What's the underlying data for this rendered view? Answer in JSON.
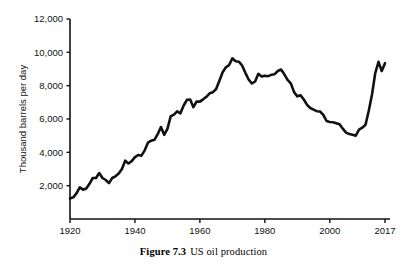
{
  "figure": {
    "caption_number": "Figure 7.3",
    "caption_text": "US oil production"
  },
  "chart_data": {
    "type": "line",
    "title": "",
    "subtitle": "",
    "xlabel": "",
    "ylabel": "Thousand barrels per day",
    "xlim": [
      1920,
      2017
    ],
    "ylim": [
      0,
      12000
    ],
    "grid": false,
    "legend": null,
    "x_ticks": [
      1920,
      1940,
      1960,
      1980,
      2000,
      2017
    ],
    "x_tick_labels": [
      "1920",
      "1940",
      "1960",
      "1980",
      "2000",
      "2017"
    ],
    "y_ticks": [
      2000,
      4000,
      6000,
      8000,
      10000,
      12000
    ],
    "y_tick_labels": [
      "2,000",
      "4,000",
      "6,000",
      "8,000",
      "10,000",
      "12,000"
    ],
    "line_color": "#111111",
    "line_width": 2.6,
    "series": [
      {
        "name": "US oil production",
        "x": [
          1920,
          1921,
          1922,
          1923,
          1924,
          1925,
          1926,
          1927,
          1928,
          1929,
          1930,
          1931,
          1932,
          1933,
          1934,
          1935,
          1936,
          1937,
          1938,
          1939,
          1940,
          1941,
          1942,
          1943,
          1944,
          1945,
          1946,
          1947,
          1948,
          1949,
          1950,
          1951,
          1952,
          1953,
          1954,
          1955,
          1956,
          1957,
          1958,
          1959,
          1960,
          1961,
          1962,
          1963,
          1964,
          1965,
          1966,
          1967,
          1968,
          1969,
          1970,
          1971,
          1972,
          1973,
          1974,
          1975,
          1976,
          1977,
          1978,
          1979,
          1980,
          1981,
          1982,
          1983,
          1984,
          1985,
          1986,
          1987,
          1988,
          1989,
          1990,
          1991,
          1992,
          1993,
          1994,
          1995,
          1996,
          1997,
          1998,
          1999,
          2000,
          2001,
          2002,
          2003,
          2004,
          2005,
          2006,
          2007,
          2008,
          2009,
          2010,
          2011,
          2012,
          2013,
          2014,
          2015,
          2016,
          2017
        ],
        "values": [
          1230,
          1300,
          1540,
          1900,
          1760,
          1830,
          2110,
          2460,
          2460,
          2760,
          2460,
          2340,
          2150,
          2460,
          2560,
          2730,
          3000,
          3500,
          3330,
          3470,
          3710,
          3840,
          3800,
          4120,
          4580,
          4700,
          4750,
          5090,
          5520,
          5050,
          5410,
          6160,
          6260,
          6460,
          6340,
          6810,
          7150,
          7170,
          6710,
          7050,
          7040,
          7180,
          7330,
          7540,
          7610,
          7800,
          8300,
          8810,
          9100,
          9240,
          9640,
          9460,
          9440,
          9210,
          8770,
          8370,
          8130,
          8250,
          8710,
          8550,
          8600,
          8570,
          8650,
          8690,
          8880,
          8970,
          8680,
          8350,
          8140,
          7610,
          7360,
          7420,
          7170,
          6850,
          6660,
          6560,
          6470,
          6450,
          6250,
          5880,
          5820,
          5800,
          5750,
          5680,
          5420,
          5180,
          5100,
          5060,
          5000,
          5360,
          5480,
          5650,
          6500,
          7470,
          8760,
          9430,
          8880,
          9350
        ]
      }
    ],
    "annotations": {
      "peak_1970": 9640,
      "trough_2008": 5000,
      "recent_peak_2015": 9430,
      "start_1920": 1230,
      "end_2017": 9350
    }
  }
}
